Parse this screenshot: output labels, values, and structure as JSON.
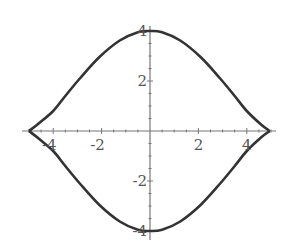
{
  "chart_data": {
    "type": "line",
    "title": "",
    "xlabel": "",
    "ylabel": "",
    "xlim": [
      -5.2,
      5.9
    ],
    "ylim": [
      -4.3,
      5.2
    ],
    "grid": false,
    "legend": null,
    "x_ticks": [
      -4,
      -2,
      2,
      4
    ],
    "x_tick_labels": [
      "-4",
      "-2",
      "2",
      "4"
    ],
    "y_ticks": [
      -4,
      -2,
      2,
      4
    ],
    "y_tick_labels": [
      "-4",
      "-2",
      "2",
      "4"
    ],
    "series": [
      {
        "name": "upper branch",
        "color": "#333333",
        "x": [
          -5.0,
          -4.6,
          -4.0,
          -3.5,
          -2.9,
          -2.1,
          -1.25,
          -0.5,
          0,
          0.5,
          1.25,
          2.1,
          2.9,
          3.5,
          4.0,
          4.6,
          4.95
        ],
        "y": [
          0.0,
          0.3,
          0.8,
          1.4,
          2.1,
          2.95,
          3.62,
          3.95,
          4.0,
          3.95,
          3.62,
          2.95,
          2.1,
          1.4,
          0.8,
          0.25,
          0.0
        ]
      },
      {
        "name": "lower branch",
        "color": "#333333",
        "x": [
          -5.0,
          -4.6,
          -4.0,
          -3.5,
          -2.9,
          -2.1,
          -1.25,
          -0.5,
          0,
          0.5,
          1.25,
          2.1,
          2.9,
          3.5,
          4.0,
          4.6,
          4.95
        ],
        "y": [
          0.0,
          -0.3,
          -0.8,
          -1.4,
          -2.1,
          -2.95,
          -3.62,
          -3.95,
          -4.0,
          -3.95,
          -3.62,
          -2.95,
          -2.1,
          -1.4,
          -0.8,
          -0.25,
          0.0
        ]
      }
    ],
    "axis_color": "#777777",
    "curve_color": "#333333"
  }
}
